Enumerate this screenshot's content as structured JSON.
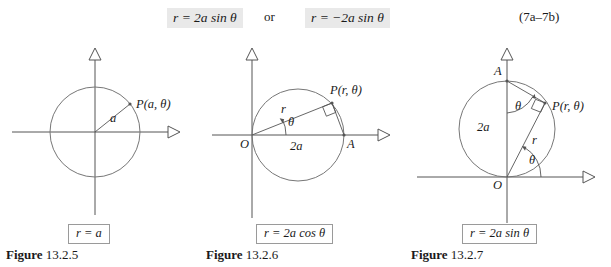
{
  "equation_row": {
    "left_equation": "r = 2a sin θ",
    "connector": "or",
    "right_equation": "r = −2a sin θ",
    "equation_number": "(7a–7b)"
  },
  "figures": [
    {
      "id": "figure-13-2-5",
      "caption_prefix": "Figure",
      "caption_number": "13.2.5",
      "formula": "r = a",
      "labels": [
        {
          "name": "radius-label",
          "text": "a"
        },
        {
          "name": "point-label-p",
          "text": "P(a, θ)"
        }
      ],
      "geometry": {
        "circle_center_x": 95,
        "circle_center_y": 94,
        "radius": 45,
        "x_axis": {
          "x1": 12,
          "x2": 174,
          "y": 94
        },
        "y_axis": {
          "x": 95,
          "y1": 10,
          "y2": 177
        },
        "point_p": {
          "x": 130,
          "y": 66
        }
      }
    },
    {
      "id": "figure-13-2-6",
      "caption_prefix": "Figure",
      "caption_number": "13.2.6",
      "formula": "r = 2a cos θ",
      "labels": [
        {
          "name": "origin-label",
          "text": "O"
        },
        {
          "name": "point-label-a",
          "text": "A"
        },
        {
          "name": "diameter-label",
          "text": "2a"
        },
        {
          "name": "radius-label",
          "text": "r"
        },
        {
          "name": "angle-label",
          "text": "θ"
        },
        {
          "name": "point-label-p",
          "text": "P(r, θ)"
        }
      ],
      "geometry": {
        "circle_center_x": 98,
        "circle_center_y": 97,
        "radius": 46,
        "x_axis": {
          "x1": 12,
          "x2": 184,
          "y": 97
        },
        "y_axis": {
          "x": 52,
          "y1": 10,
          "y2": 180
        },
        "origin": {
          "x": 52,
          "y": 97
        },
        "point_a": {
          "x": 144,
          "y": 97
        },
        "point_p": {
          "x": 132,
          "y": 65
        }
      }
    },
    {
      "id": "figure-13-2-7",
      "caption_prefix": "Figure",
      "caption_number": "13.2.7",
      "formula": "r = 2a sin θ",
      "labels": [
        {
          "name": "point-label-a",
          "text": "A"
        },
        {
          "name": "origin-label",
          "text": "O"
        },
        {
          "name": "diameter-label",
          "text": "2a"
        },
        {
          "name": "radius-label",
          "text": "r"
        },
        {
          "name": "angle-label-top",
          "text": "θ"
        },
        {
          "name": "angle-label-bottom",
          "text": "θ"
        },
        {
          "name": "point-label-p",
          "text": "P(r, θ)"
        }
      ],
      "geometry": {
        "circle_center_x": 102,
        "circle_center_y": 91,
        "radius": 48,
        "x_axis": {
          "x1": 12,
          "x2": 190,
          "y": 139
        },
        "y_axis": {
          "x": 102,
          "y1": 10,
          "y2": 185
        },
        "origin": {
          "x": 102,
          "y": 139
        },
        "point_a": {
          "x": 102,
          "y": 43
        },
        "point_p": {
          "x": 140,
          "y": 65
        }
      }
    }
  ],
  "colors": {
    "ink": "#1a1a1a",
    "stroke": "#555555",
    "highlight_bg": "#e9e9e9",
    "box_border": "#9a9a9a",
    "background": "#ffffff"
  }
}
